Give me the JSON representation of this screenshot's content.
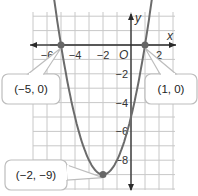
{
  "chart_data": {
    "type": "line",
    "title": "",
    "xlabel": "x",
    "ylabel": "y",
    "origin_label": "O",
    "xlim": [
      -7,
      3
    ],
    "ylim": [
      -10,
      2
    ],
    "grid": true,
    "x_ticks": [
      {
        "value": -6,
        "label": "−6"
      },
      {
        "value": -4,
        "label": "−4"
      },
      {
        "value": -2,
        "label": "−2"
      },
      {
        "value": 2,
        "label": "2"
      }
    ],
    "y_ticks": [
      {
        "value": -2,
        "label": "−2"
      },
      {
        "value": -4,
        "label": "−4"
      },
      {
        "value": -6,
        "label": "−6"
      },
      {
        "value": -8,
        "label": "−8"
      }
    ],
    "series": [
      {
        "name": "parabola",
        "equation": "y = (x + 5)(x - 1)",
        "color": "#6b6b6b",
        "x": [
          -5.8,
          -5,
          -4,
          -3,
          -2,
          -1,
          0,
          1,
          1.8
        ],
        "y": [
          6.08,
          0,
          -5,
          -8,
          -9,
          -8,
          -5,
          0,
          6.08
        ]
      }
    ],
    "annotations": [
      {
        "point": [
          -5,
          0
        ],
        "label": "(−5, 0)"
      },
      {
        "point": [
          1,
          0
        ],
        "label": "(1, 0)"
      },
      {
        "point": [
          -2,
          -9
        ],
        "label": "(−2, −9)"
      }
    ],
    "colors": {
      "grid": "#c8c8c8",
      "axis": "#2a2a2a",
      "point": "#666666",
      "callout_border": "#bdbdbd"
    }
  }
}
